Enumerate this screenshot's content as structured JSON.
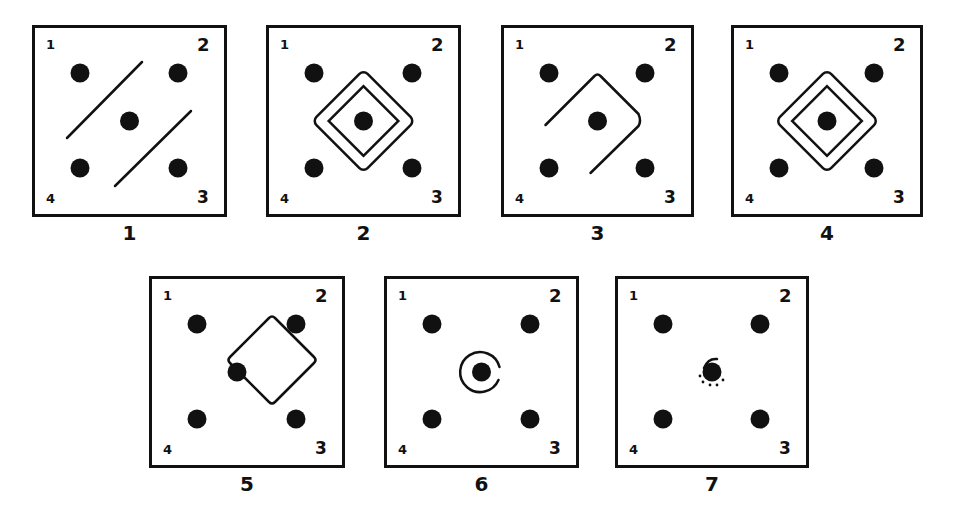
{
  "figure": {
    "ink_color": "#111111",
    "background": "#ffffff",
    "corner_labels": [
      "1",
      "2",
      "3",
      "4"
    ],
    "panels": [
      {
        "id": "1",
        "caption": "1",
        "x": 32,
        "y": 25,
        "w": 195,
        "h": 192,
        "figure": "two-parallel-diagonal-lines"
      },
      {
        "id": "2",
        "caption": "2",
        "x": 266,
        "y": 25,
        "w": 195,
        "h": 192,
        "figure": "closed-rounded-diamond"
      },
      {
        "id": "3",
        "caption": "3",
        "x": 501,
        "y": 25,
        "w": 193,
        "h": 192,
        "figure": "open-rounded-diamond"
      },
      {
        "id": "4",
        "caption": "4",
        "x": 731,
        "y": 25,
        "w": 192,
        "h": 192,
        "figure": "closed-rounded-diamond"
      },
      {
        "id": "5",
        "caption": "5",
        "x": 149,
        "y": 276,
        "w": 196,
        "h": 192,
        "figure": "offset-rounded-diamond"
      },
      {
        "id": "6",
        "caption": "6",
        "x": 384,
        "y": 276,
        "w": 195,
        "h": 192,
        "figure": "circle-around-center"
      },
      {
        "id": "7",
        "caption": "7",
        "x": 615,
        "y": 276,
        "w": 194,
        "h": 192,
        "figure": "small-marks-around-center"
      }
    ]
  }
}
